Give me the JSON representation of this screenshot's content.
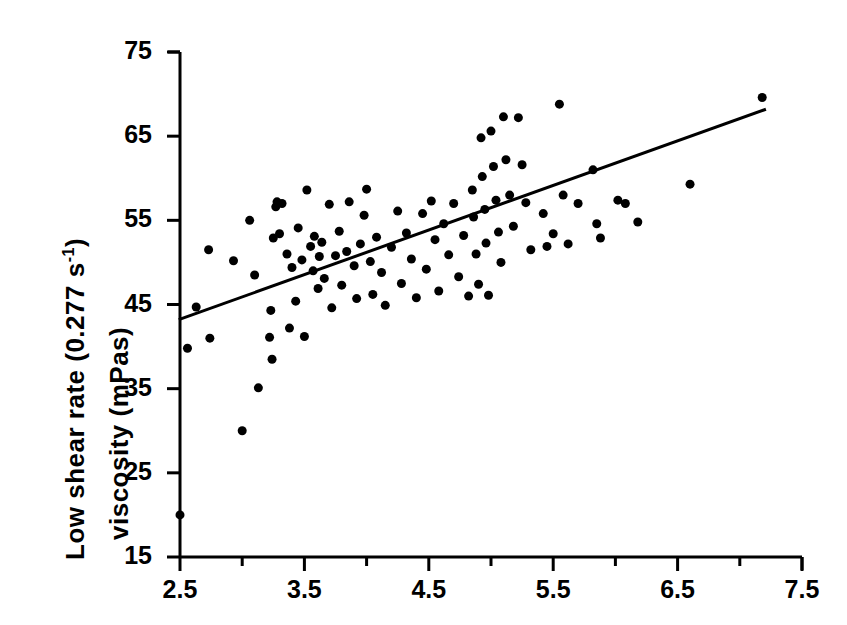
{
  "figure": {
    "background_color": "#ffffff",
    "ink_color": "#000000"
  },
  "axis_labels": {
    "y_line1_prefix": "Low shear rate (0.277 s",
    "y_line1_exponent": "-1",
    "y_line1_suffix": ")",
    "y_line2": "viscosity (mPas)",
    "x_label": ""
  },
  "chart_data": {
    "type": "scatter",
    "title": "",
    "xlabel": "",
    "ylabel": "Low shear rate (0.277 s^-1) viscosity (mPas)",
    "xlim": [
      2.5,
      7.5
    ],
    "ylim": [
      15,
      75
    ],
    "xticks": [
      2.5,
      3.5,
      4.5,
      5.5,
      6.5,
      7.5
    ],
    "xtick_labels": [
      "2.5",
      "3.5",
      "4.5",
      "5.5",
      "6.5",
      "7.5"
    ],
    "x_minor_ticks": [
      3.0,
      4.0,
      5.0,
      6.0,
      7.0
    ],
    "yticks": [
      15,
      25,
      35,
      45,
      55,
      65,
      75
    ],
    "ytick_labels": [
      "15",
      "25",
      "35",
      "45",
      "55",
      "65",
      "75"
    ],
    "grid": false,
    "legend": null,
    "marker": {
      "shape": "circle",
      "color": "#000000",
      "size_px": 9
    },
    "trendline": {
      "type": "linear-fit",
      "color": "#000000",
      "width_px": 3,
      "x_start": 2.49,
      "y_start": 43.2,
      "x_end": 7.21,
      "y_end": 68.2
    },
    "points": [
      [
        2.5,
        20.0
      ],
      [
        2.56,
        39.8
      ],
      [
        2.63,
        44.7
      ],
      [
        2.73,
        51.5
      ],
      [
        2.74,
        41.0
      ],
      [
        2.93,
        50.2
      ],
      [
        3.0,
        30.0
      ],
      [
        3.06,
        55.0
      ],
      [
        3.1,
        48.5
      ],
      [
        3.13,
        35.1
      ],
      [
        3.22,
        41.1
      ],
      [
        3.23,
        44.3
      ],
      [
        3.24,
        38.5
      ],
      [
        3.25,
        52.9
      ],
      [
        3.27,
        56.6
      ],
      [
        3.28,
        57.2
      ],
      [
        3.3,
        53.4
      ],
      [
        3.32,
        57.0
      ],
      [
        3.36,
        51.0
      ],
      [
        3.38,
        42.2
      ],
      [
        3.4,
        49.4
      ],
      [
        3.43,
        45.4
      ],
      [
        3.45,
        54.1
      ],
      [
        3.48,
        50.3
      ],
      [
        3.5,
        41.2
      ],
      [
        3.52,
        58.6
      ],
      [
        3.55,
        51.9
      ],
      [
        3.57,
        49.0
      ],
      [
        3.58,
        53.1
      ],
      [
        3.61,
        46.9
      ],
      [
        3.62,
        50.7
      ],
      [
        3.64,
        52.4
      ],
      [
        3.66,
        48.1
      ],
      [
        3.7,
        56.9
      ],
      [
        3.72,
        44.6
      ],
      [
        3.75,
        50.8
      ],
      [
        3.78,
        53.7
      ],
      [
        3.8,
        47.3
      ],
      [
        3.84,
        51.3
      ],
      [
        3.86,
        57.2
      ],
      [
        3.9,
        49.6
      ],
      [
        3.92,
        45.7
      ],
      [
        3.95,
        52.2
      ],
      [
        3.98,
        55.6
      ],
      [
        4.0,
        58.7
      ],
      [
        4.03,
        50.1
      ],
      [
        4.05,
        46.2
      ],
      [
        4.08,
        53.0
      ],
      [
        4.12,
        48.8
      ],
      [
        4.15,
        44.9
      ],
      [
        4.2,
        51.8
      ],
      [
        4.25,
        56.1
      ],
      [
        4.28,
        47.5
      ],
      [
        4.32,
        53.5
      ],
      [
        4.36,
        50.4
      ],
      [
        4.4,
        45.8
      ],
      [
        4.45,
        55.8
      ],
      [
        4.48,
        49.2
      ],
      [
        4.52,
        57.3
      ],
      [
        4.55,
        52.7
      ],
      [
        4.58,
        46.6
      ],
      [
        4.62,
        54.6
      ],
      [
        4.66,
        50.9
      ],
      [
        4.7,
        57.0
      ],
      [
        4.74,
        48.3
      ],
      [
        4.78,
        53.2
      ],
      [
        4.82,
        46.0
      ],
      [
        4.85,
        58.6
      ],
      [
        4.86,
        55.4
      ],
      [
        4.88,
        51.0
      ],
      [
        4.9,
        47.4
      ],
      [
        4.92,
        64.8
      ],
      [
        4.93,
        60.2
      ],
      [
        4.95,
        56.3
      ],
      [
        4.96,
        52.3
      ],
      [
        4.98,
        46.1
      ],
      [
        5.0,
        65.6
      ],
      [
        5.02,
        61.4
      ],
      [
        5.04,
        57.4
      ],
      [
        5.06,
        53.6
      ],
      [
        5.08,
        50.0
      ],
      [
        5.1,
        67.3
      ],
      [
        5.12,
        62.2
      ],
      [
        5.15,
        58.0
      ],
      [
        5.18,
        54.3
      ],
      [
        5.22,
        67.2
      ],
      [
        5.25,
        61.6
      ],
      [
        5.28,
        57.1
      ],
      [
        5.32,
        51.5
      ],
      [
        5.42,
        55.8
      ],
      [
        5.45,
        51.9
      ],
      [
        5.5,
        53.4
      ],
      [
        5.55,
        68.8
      ],
      [
        5.58,
        58.0
      ],
      [
        5.62,
        52.2
      ],
      [
        5.7,
        57.0
      ],
      [
        5.82,
        61.0
      ],
      [
        5.85,
        54.6
      ],
      [
        5.88,
        52.9
      ],
      [
        6.02,
        57.4
      ],
      [
        6.08,
        57.0
      ],
      [
        6.18,
        54.8
      ],
      [
        6.6,
        59.3
      ],
      [
        7.18,
        69.6
      ]
    ],
    "n_points": 106
  }
}
